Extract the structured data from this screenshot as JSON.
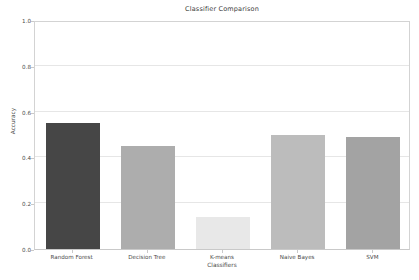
{
  "chart_data": {
    "type": "bar",
    "title": "Classifier Comparison",
    "xlabel": "Classifiers",
    "ylabel": "Accuracy",
    "categories": [
      "Random Forest",
      "Decision Tree",
      "K-means",
      "Naive Bayes",
      "SVM"
    ],
    "values": [
      0.55,
      0.45,
      0.14,
      0.5,
      0.49
    ],
    "bar_colors": [
      "#464646",
      "#adadad",
      "#e8e8e8",
      "#bcbcbc",
      "#a3a3a3"
    ],
    "ylim": [
      0.0,
      1.0
    ],
    "ytick_labels": [
      "0.0",
      "0.2",
      "0.4",
      "0.6",
      "0.8",
      "1.0"
    ],
    "ytick_values": [
      0.0,
      0.2,
      0.4,
      0.6,
      0.8,
      1.0
    ],
    "grid": true,
    "grid_color": "#e6e6e6",
    "legend": null,
    "background_color": "#ffffff",
    "axis_color": "#d3d3d3"
  }
}
